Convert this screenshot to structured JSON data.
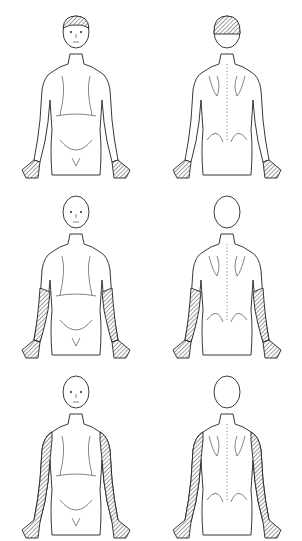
{
  "diagram": {
    "type": "anatomical-dermatome-chart",
    "layout": {
      "rows": 3,
      "columns": 2,
      "columns_views": [
        "anterior",
        "posterior"
      ]
    },
    "hatch_color": "#222222",
    "background": "#ffffff",
    "figures": [
      {
        "row": 1,
        "view": "anterior",
        "hatched_regions": [
          "head-crown",
          "hands"
        ]
      },
      {
        "row": 1,
        "view": "posterior",
        "hatched_regions": [
          "head-back",
          "hands"
        ]
      },
      {
        "row": 2,
        "view": "anterior",
        "hatched_regions": [
          "forearms",
          "hands"
        ]
      },
      {
        "row": 2,
        "view": "posterior",
        "hatched_regions": [
          "forearms",
          "hands"
        ]
      },
      {
        "row": 3,
        "view": "anterior",
        "hatched_regions": [
          "upper-arms",
          "forearms",
          "hands"
        ]
      },
      {
        "row": 3,
        "view": "posterior",
        "hatched_regions": [
          "upper-arms",
          "forearms",
          "hands"
        ]
      }
    ]
  }
}
